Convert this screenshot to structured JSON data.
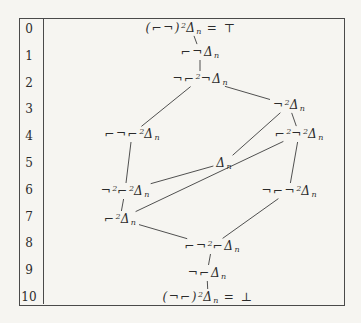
{
  "page": {
    "background": "#f6f5f1",
    "ink_color": "#2b2b2b",
    "line_color": "#3d3d3d",
    "frame_color": "#4a4a4a"
  },
  "figure": {
    "frame": {
      "left": 19,
      "top": 18,
      "width": 324,
      "height": 286
    },
    "level_column": {
      "center_x": 29,
      "separator_x": 43,
      "top_y": 29,
      "row_spacing": 26.8
    },
    "levels": [
      "0",
      "1",
      "2",
      "3",
      "4",
      "5",
      "6",
      "7",
      "8",
      "9",
      "10"
    ],
    "nodes": [
      {
        "id": "top",
        "level": 0,
        "x": 191,
        "y": 28,
        "formula": "(⌐¬)^2Δ_n = ⊤"
      },
      {
        "id": "l1",
        "level": 1,
        "x": 200,
        "y": 52,
        "formula": "⌐¬Δ_n"
      },
      {
        "id": "l2",
        "level": 2,
        "x": 200,
        "y": 79,
        "formula": "¬⌐^2¬Δ_n"
      },
      {
        "id": "l3",
        "level": 3,
        "x": 289,
        "y": 105,
        "formula": "¬^2Δ_n"
      },
      {
        "id": "l4a",
        "level": 4,
        "x": 132,
        "y": 134,
        "formula": "⌐¬⌐^2Δ_n"
      },
      {
        "id": "l4b",
        "level": 4,
        "x": 299,
        "y": 134,
        "formula": "⌐^2¬^2Δ_n"
      },
      {
        "id": "l5",
        "level": 5,
        "x": 224,
        "y": 163,
        "formula": "Δ_n"
      },
      {
        "id": "l6a",
        "level": 6,
        "x": 125,
        "y": 191,
        "formula": "¬^2⌐^2Δ_n"
      },
      {
        "id": "l6b",
        "level": 6,
        "x": 289,
        "y": 191,
        "formula": "¬⌐¬^2Δ_n"
      },
      {
        "id": "l7",
        "level": 7,
        "x": 120,
        "y": 219,
        "formula": "⌐^2Δ_n"
      },
      {
        "id": "l8",
        "level": 8,
        "x": 212,
        "y": 246,
        "formula": "⌐¬^2⌐Δ_n"
      },
      {
        "id": "l9",
        "level": 9,
        "x": 207,
        "y": 273,
        "formula": "¬⌐Δ_n"
      },
      {
        "id": "bot",
        "level": 10,
        "x": 208,
        "y": 297,
        "formula": "(¬⌐)^2Δ_n = ⊥"
      }
    ],
    "edges": [
      [
        "top",
        "l1"
      ],
      [
        "l1",
        "l2"
      ],
      [
        "l2",
        "l4a"
      ],
      [
        "l2",
        "l3"
      ],
      [
        "l3",
        "l4b"
      ],
      [
        "l3",
        "l5"
      ],
      [
        "l4a",
        "l6a"
      ],
      [
        "l4b",
        "l6b"
      ],
      [
        "l5",
        "l6a"
      ],
      [
        "l6a",
        "l7"
      ],
      [
        "l7",
        "l4b"
      ],
      [
        "l7",
        "l8"
      ],
      [
        "l6b",
        "l8"
      ],
      [
        "l8",
        "l9"
      ],
      [
        "l9",
        "bot"
      ]
    ]
  }
}
